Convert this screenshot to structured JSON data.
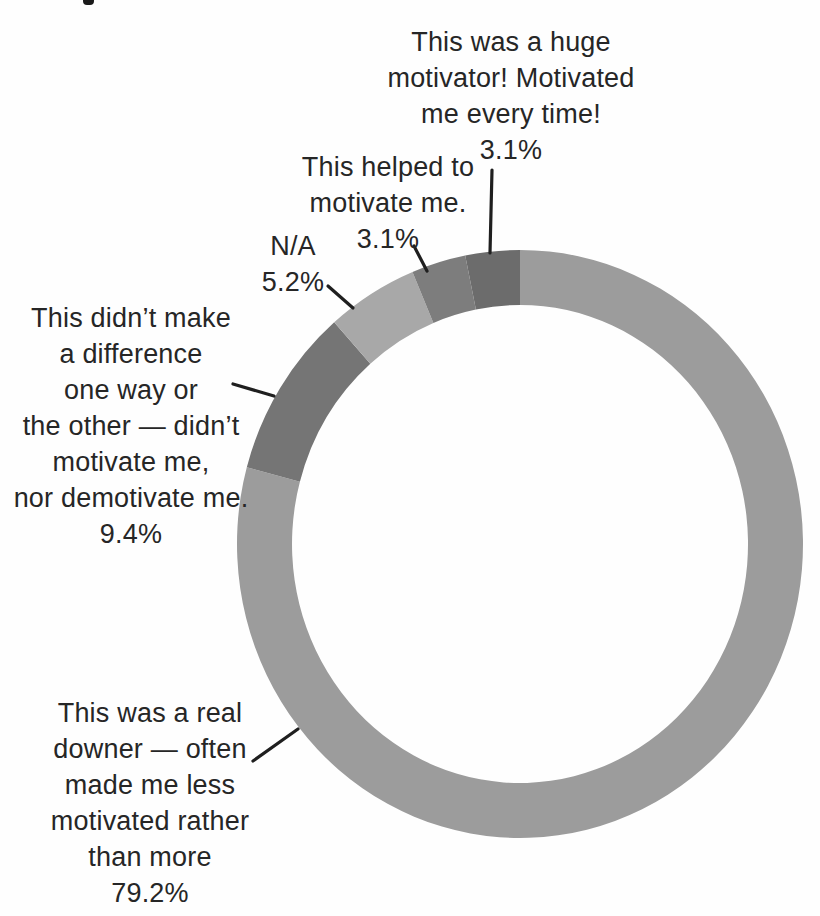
{
  "chart_data": {
    "type": "pie",
    "variant": "donut",
    "title": "",
    "legend": "none",
    "start_angle_deg": 0,
    "direction": "clockwise",
    "slices": [
      {
        "key": "downer",
        "label": "This was a real downer — often made me less motivated rather than more",
        "value_pct": 79.2,
        "color": "#9c9c9c"
      },
      {
        "key": "no-difference",
        "label": "This didn’t make a difference one way or the other — didn’t motivate me, nor demotivate me.",
        "value_pct": 9.4,
        "color": "#757575"
      },
      {
        "key": "na",
        "label": "N/A",
        "value_pct": 5.2,
        "color": "#a8a8a8"
      },
      {
        "key": "helped",
        "label": "This helped to motivate me.",
        "value_pct": 3.1,
        "color": "#7d7d7d"
      },
      {
        "key": "huge-motivator",
        "label": "This was a huge motivator! Motivated me every time!",
        "value_pct": 3.1,
        "color": "#6c6c6c"
      }
    ]
  },
  "labels": {
    "huge": "This was a huge\nmotivator! Motivated\nme every time!\n3.1%",
    "helped": "This helped to\nmotivate me.\n3.1%",
    "na": "N/A\n5.2%",
    "no_difference": "This didn’t make\na difference\none way or\nthe other — didn’t\nmotivate me,\nnor demotivate me.\n9.4%",
    "downer": "This was a real\ndowner — often\nmade me less\nmotivated rather\nthan more\n79.2%"
  },
  "colors": {
    "leader_line": "#1f1f1f",
    "text": "#262626",
    "background": "#fefefe"
  }
}
